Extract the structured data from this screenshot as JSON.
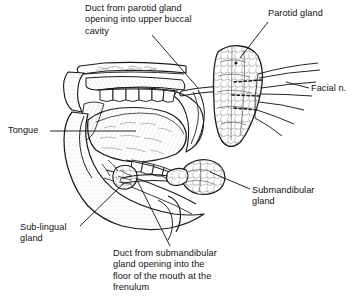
{
  "figure": {
    "background_color": "#ffffff",
    "ink_color": "#1a1a1a",
    "width": 355,
    "height": 299
  },
  "labels": {
    "parotid_duct": "Duct from parotid gland\nopening into upper buccal\ncavity",
    "parotid_gland": "Parotid gland",
    "facial_nerve": "Facial n.",
    "tongue": "Tongue",
    "submandibular_gland": "Submandibular\ngland",
    "sublingual_gland": "Sub-lingual\ngland",
    "submandibular_duct": "Duct from submandibular\ngland opening into the\nfloor of the mouth at the\nfrenulum"
  },
  "structures": [
    {
      "name": "parotid-gland",
      "description": "Lobulated gland mass posterior to the ramus of the mandible"
    },
    {
      "name": "parotid-duct",
      "description": "Stensen's duct crossing the cheek to the upper buccal cavity"
    },
    {
      "name": "facial-nerve",
      "description": "Branches fanning posteriorly from the parotid gland"
    },
    {
      "name": "tongue",
      "description": "Tongue body within the oral cavity"
    },
    {
      "name": "hard-palate",
      "description": "Roof of the mouth above the tongue"
    },
    {
      "name": "upper-teeth",
      "description": "Row of maxillary teeth"
    },
    {
      "name": "lower-teeth",
      "description": "Row of mandibular teeth"
    },
    {
      "name": "submandibular-gland",
      "description": "Lobulated gland below the mandible"
    },
    {
      "name": "submandibular-duct",
      "description": "Wharton's duct running forward to the floor of the mouth"
    },
    {
      "name": "sublingual-gland",
      "description": "Gland in the floor of the mouth beneath the tongue"
    },
    {
      "name": "mandible",
      "description": "Lower jaw bone outline with lip and chin profile"
    }
  ]
}
